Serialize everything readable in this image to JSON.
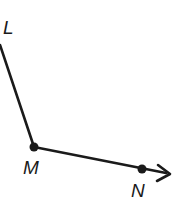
{
  "diagram": {
    "type": "angle",
    "colors": {
      "stroke": "#1a1a1a",
      "background": "#ffffff"
    },
    "points": [
      {
        "name": "L",
        "label": "L",
        "x": 0,
        "y": 45,
        "label_x": 4,
        "label_y": 33,
        "has_dot": false
      },
      {
        "name": "M",
        "label": "M",
        "x": 34,
        "y": 147,
        "label_x": 24,
        "label_y": 174,
        "has_dot": true
      },
      {
        "name": "N",
        "label": "N",
        "x": 142,
        "y": 169,
        "label_x": 131,
        "label_y": 197,
        "has_dot": true
      }
    ],
    "segments": [
      {
        "from": "L",
        "to": "M",
        "type": "segment"
      },
      {
        "from": "M",
        "to": "N",
        "type": "ray",
        "arrow_tip": {
          "x": 170,
          "y": 174
        }
      }
    ],
    "labels": {
      "L": "L",
      "M": "M",
      "N": "N"
    }
  }
}
